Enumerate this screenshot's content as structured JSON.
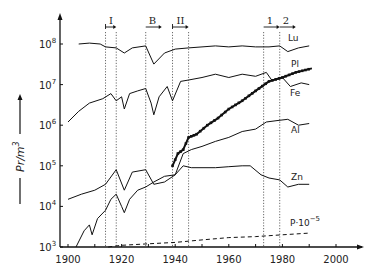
{
  "chart_data": {
    "type": "line",
    "title": "",
    "xlabel": "",
    "ylabel": "Pr/m³",
    "yscale": "log",
    "xlim": [
      1900,
      2010
    ],
    "ylim": [
      1000,
      300000000
    ],
    "grid": false,
    "x_ticks": [
      1900,
      1920,
      1940,
      1960,
      1980,
      2000
    ],
    "x_tick_labels": [
      "1900",
      "1920",
      "1940",
      "1960",
      "1980",
      "2000"
    ],
    "y_ticks": [
      1000,
      10000,
      100000,
      1000000,
      10000000,
      100000000
    ],
    "y_tick_labels": [
      {
        "base": "10",
        "exp": "3"
      },
      {
        "base": "10",
        "exp": "4"
      },
      {
        "base": "10",
        "exp": "5"
      },
      {
        "base": "10",
        "exp": "6"
      },
      {
        "base": "10",
        "exp": "7"
      },
      {
        "base": "10",
        "exp": "8"
      }
    ],
    "period_markers": [
      {
        "label": "I",
        "start": 1914,
        "end": 1918
      },
      {
        "label": "B",
        "start": 1929,
        "end": null
      },
      {
        "label": "II",
        "start": 1939,
        "end": 1945
      },
      {
        "label": "1",
        "start": 1973,
        "end": null
      },
      {
        "label": "2",
        "start": 1979,
        "end": null
      }
    ],
    "series": [
      {
        "name": "Lu",
        "style": "solid",
        "points": [
          [
            1904,
            100000000.0
          ],
          [
            1908,
            105000000.0
          ],
          [
            1912,
            100000000.0
          ],
          [
            1914,
            85000000.0
          ],
          [
            1918,
            80000000.0
          ],
          [
            1921,
            60000000.0
          ],
          [
            1924,
            80000000.0
          ],
          [
            1929,
            90000000.0
          ],
          [
            1932,
            32000000.0
          ],
          [
            1936,
            60000000.0
          ],
          [
            1940,
            75000000.0
          ],
          [
            1945,
            80000000.0
          ],
          [
            1950,
            85000000.0
          ],
          [
            1955,
            90000000.0
          ],
          [
            1960,
            85000000.0
          ],
          [
            1965,
            90000000.0
          ],
          [
            1970,
            85000000.0
          ],
          [
            1975,
            85000000.0
          ],
          [
            1979,
            90000000.0
          ],
          [
            1982,
            65000000.0
          ],
          [
            1986,
            80000000.0
          ],
          [
            1990,
            90000000.0
          ]
        ]
      },
      {
        "name": "Fe",
        "style": "solid",
        "points": [
          [
            1900,
            1200000.0
          ],
          [
            1904,
            2200000.0
          ],
          [
            1908,
            3500000.0
          ],
          [
            1913,
            4500000.0
          ],
          [
            1916,
            6000000.0
          ],
          [
            1918,
            4000000.0
          ],
          [
            1920,
            5000000.0
          ],
          [
            1921,
            2500000.0
          ],
          [
            1923,
            6000000.0
          ],
          [
            1926,
            7000000.0
          ],
          [
            1929,
            8000000.0
          ],
          [
            1931,
            3500000.0
          ],
          [
            1932,
            1800000.0
          ],
          [
            1934,
            5000000.0
          ],
          [
            1937,
            9000000.0
          ],
          [
            1939,
            4000000.0
          ],
          [
            1942,
            12000000.0
          ],
          [
            1945,
            13000000.0
          ],
          [
            1950,
            15000000.0
          ],
          [
            1955,
            18000000.0
          ],
          [
            1960,
            15000000.0
          ],
          [
            1965,
            18000000.0
          ],
          [
            1970,
            16000000.0
          ],
          [
            1974,
            20000000.0
          ],
          [
            1976,
            13000000.0
          ],
          [
            1980,
            15000000.0
          ],
          [
            1983,
            9000000.0
          ],
          [
            1987,
            11000000.0
          ],
          [
            1990,
            10000000.0
          ]
        ]
      },
      {
        "name": "Pl",
        "style": "solid-markers",
        "points": [
          [
            1939,
            100000.0
          ],
          [
            1941,
            200000.0
          ],
          [
            1943,
            250000.0
          ],
          [
            1945,
            500000.0
          ],
          [
            1948,
            600000.0
          ],
          [
            1952,
            1000000.0
          ],
          [
            1956,
            1500000.0
          ],
          [
            1960,
            2500000.0
          ],
          [
            1965,
            4000000.0
          ],
          [
            1970,
            7000000.0
          ],
          [
            1975,
            12000000.0
          ],
          [
            1980,
            15000000.0
          ],
          [
            1985,
            20000000.0
          ],
          [
            1991,
            25000000.0
          ]
        ]
      },
      {
        "name": "Al",
        "style": "solid",
        "points": [
          [
            1900,
            15000.0
          ],
          [
            1905,
            20000.0
          ],
          [
            1910,
            25000.0
          ],
          [
            1914,
            35000.0
          ],
          [
            1918,
            80000.0
          ],
          [
            1921,
            25000.0
          ],
          [
            1924,
            70000.0
          ],
          [
            1929,
            80000.0
          ],
          [
            1932,
            35000.0
          ],
          [
            1936,
            40000.0
          ],
          [
            1940,
            60000.0
          ],
          [
            1943,
            200000.0
          ],
          [
            1946,
            250000.0
          ],
          [
            1950,
            300000.0
          ],
          [
            1955,
            400000.0
          ],
          [
            1960,
            500000.0
          ],
          [
            1965,
            700000.0
          ],
          [
            1970,
            800000.0
          ],
          [
            1974,
            1200000.0
          ],
          [
            1978,
            1300000.0
          ],
          [
            1982,
            1400000.0
          ],
          [
            1986,
            1000000.0
          ],
          [
            1990,
            1100000.0
          ]
        ]
      },
      {
        "name": "Zn",
        "style": "solid",
        "points": [
          [
            1903,
            1000.0
          ],
          [
            1906,
            2500.0
          ],
          [
            1908,
            3500.0
          ],
          [
            1909,
            2000.0
          ],
          [
            1911,
            5000.0
          ],
          [
            1914,
            8000.0
          ],
          [
            1916,
            15000.0
          ],
          [
            1918,
            20000.0
          ],
          [
            1920,
            10000.0
          ],
          [
            1921,
            7000.0
          ],
          [
            1923,
            15000.0
          ],
          [
            1926,
            25000.0
          ],
          [
            1929,
            30000.0
          ],
          [
            1932,
            40000.0
          ],
          [
            1936,
            55000.0
          ],
          [
            1940,
            60000.0
          ],
          [
            1943,
            100000.0
          ],
          [
            1946,
            90000.0
          ],
          [
            1950,
            90000.0
          ],
          [
            1955,
            90000.0
          ],
          [
            1960,
            95000.0
          ],
          [
            1965,
            100000.0
          ],
          [
            1968,
            100000.0
          ],
          [
            1972,
            60000.0
          ],
          [
            1975,
            50000.0
          ],
          [
            1979,
            45000.0
          ],
          [
            1982,
            30000.0
          ],
          [
            1986,
            35000.0
          ],
          [
            1990,
            35000.0
          ]
        ]
      },
      {
        "name": "P·10⁻⁵",
        "style": "dashed",
        "points": [
          [
            1915,
            1000.0
          ],
          [
            1920,
            1100.0
          ],
          [
            1930,
            1200.0
          ],
          [
            1940,
            1300.0
          ],
          [
            1950,
            1500.0
          ],
          [
            1960,
            1700.0
          ],
          [
            1970,
            1800.0
          ],
          [
            1980,
            2000.0
          ],
          [
            1990,
            2200.0
          ]
        ]
      }
    ],
    "annotations": [
      {
        "text": "Lu",
        "x": 1985,
        "y": 100000000.0
      },
      {
        "text": "Pl",
        "x": 1985,
        "y": 35000000.0
      },
      {
        "text": "Fe",
        "x": 1985,
        "y": 12000000.0
      },
      {
        "text": "Al",
        "x": 1985,
        "y": 1200000.0
      },
      {
        "text": "Zn",
        "x": 1985,
        "y": 45000.0
      },
      {
        "text": "P·10⁻⁵",
        "x": 1985,
        "y": 2500.0
      }
    ]
  },
  "labels": {
    "ylabel_text": "Pr/m",
    "ylabel_sup": "3",
    "x_ticks": [
      "1900",
      "1920",
      "1940",
      "1960",
      "1980",
      "2000"
    ],
    "y_ticks_base": "10",
    "y_ticks_exp": [
      "3",
      "4",
      "5",
      "6",
      "7",
      "8"
    ],
    "periods": [
      "I",
      "B",
      "II",
      "1",
      "2"
    ],
    "series": [
      "Lu",
      "Pl",
      "Fe",
      "Al",
      "Zn",
      "P·10",
      "−5"
    ]
  }
}
